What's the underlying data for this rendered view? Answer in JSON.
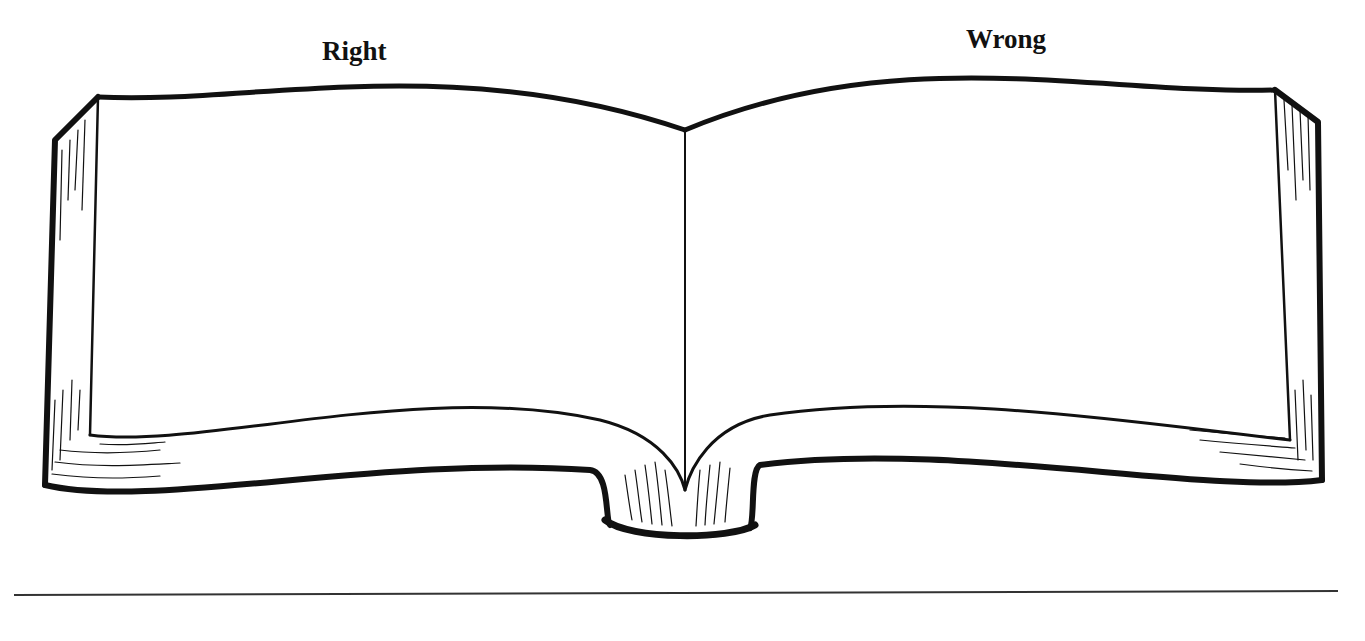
{
  "figure": {
    "type": "illustration",
    "labels": {
      "left": "Right",
      "right": "Wrong"
    },
    "colors": {
      "ink": "#111111",
      "background": "#ffffff",
      "rule": "#333333"
    }
  }
}
